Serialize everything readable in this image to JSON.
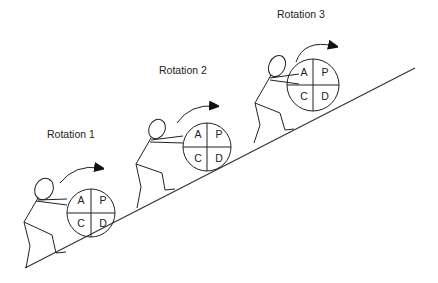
{
  "diagram": {
    "type": "illustration",
    "stroke_color": "#222222",
    "background": "#ffffff",
    "slope": {
      "from": [
        25,
        268
      ],
      "to": [
        415,
        68
      ]
    },
    "rotations": [
      {
        "label": "Rotation 1",
        "quadrants": {
          "top_left": "A",
          "top_right": "P",
          "bottom_left": "C",
          "bottom_right": "D"
        }
      },
      {
        "label": "Rotation 2",
        "quadrants": {
          "top_left": "A",
          "top_right": "P",
          "bottom_left": "C",
          "bottom_right": "D"
        }
      },
      {
        "label": "Rotation 3",
        "quadrants": {
          "top_left": "A",
          "top_right": "P",
          "bottom_left": "C",
          "bottom_right": "D"
        }
      }
    ]
  }
}
